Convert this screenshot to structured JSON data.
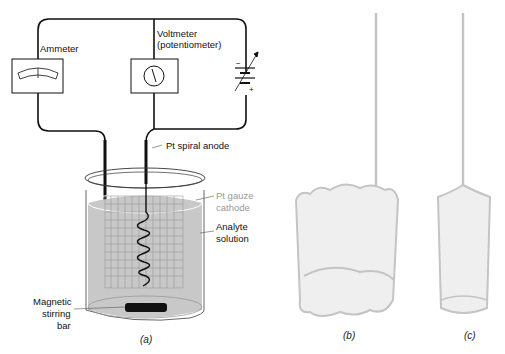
{
  "panel_a": {
    "labels": {
      "ammeter": "Ammeter",
      "voltmeter_line1": "Voltmeter",
      "voltmeter_line2": "(potentiometer)",
      "anode": "Pt spiral anode",
      "cathode_line1": "Pt gauze",
      "cathode_line2": "cathode",
      "analyte_line1": "Analyte",
      "analyte_line2": "solution",
      "stir_line1": "Magnetic",
      "stir_line2": "stirring",
      "stir_line3": "bar",
      "battery_minus": "−",
      "battery_plus": "+"
    },
    "caption": "(a)"
  },
  "panel_b": {
    "caption": "(b)"
  },
  "panel_c": {
    "caption": "(c)"
  },
  "colors": {
    "solution": "#c8c8c8",
    "gauze_light": "#d6d6d6",
    "wire": "#111111"
  }
}
